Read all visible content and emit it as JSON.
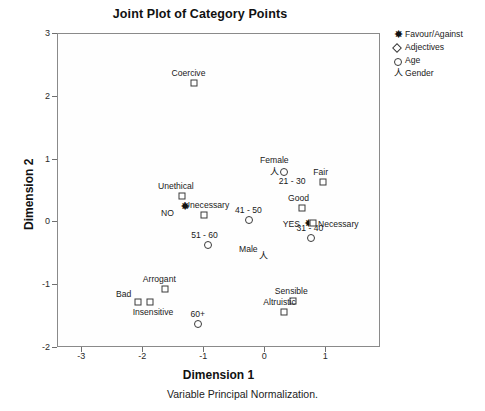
{
  "chart_data": {
    "type": "scatter",
    "title": "Joint Plot of Category Points",
    "xlabel": "Dimension 1",
    "ylabel": "Dimension 2",
    "footnote": "Variable Principal Normalization.",
    "xlim": [
      -3.4,
      1.9
    ],
    "ylim": [
      -2,
      3
    ],
    "xticks": [
      -3,
      -2,
      -1,
      0,
      1
    ],
    "yticks": [
      -2,
      -1,
      0,
      1,
      2,
      3
    ],
    "grid": false,
    "legend_position": "top-right",
    "legend": [
      {
        "label": "Favour/Against",
        "marker": "star-icon"
      },
      {
        "label": "Adjectives",
        "marker": "diamond-icon"
      },
      {
        "label": "Age",
        "marker": "circle-icon"
      },
      {
        "label": "Gender",
        "marker": "person-icon"
      }
    ],
    "series": [
      {
        "name": "Favour/Against",
        "marker": "star-icon",
        "points": [
          {
            "label": "NO",
            "x": -1.3,
            "y": 0.24,
            "label_dx": -24,
            "label_dy": 2
          },
          {
            "label": "YES",
            "x": 0.73,
            "y": -0.02,
            "label_dx": -26,
            "label_dy": -4
          }
        ]
      },
      {
        "name": "Adjectives",
        "marker": "diamond-icon",
        "points": [
          {
            "label": "Coercive",
            "x": -1.16,
            "y": 2.2,
            "label_dx": -22,
            "label_dy": -15
          },
          {
            "label": "Unethical",
            "x": -1.35,
            "y": 0.41,
            "label_dx": -24,
            "label_dy": -15
          },
          {
            "label": "Unecessary",
            "x": -0.99,
            "y": 0.1,
            "label_dx": -20,
            "label_dy": -15
          },
          {
            "label": "Fair",
            "x": 0.97,
            "y": 0.62,
            "label_dx": -10,
            "label_dy": -15
          },
          {
            "label": "Good",
            "x": 0.62,
            "y": 0.22,
            "label_dx": -14,
            "label_dy": -15
          },
          {
            "label": "Necessary",
            "x": 0.8,
            "y": -0.02,
            "label_dx": 5,
            "label_dy": -4
          },
          {
            "label": "Arrogant",
            "x": -1.63,
            "y": -1.07,
            "label_dx": -22,
            "label_dy": -15
          },
          {
            "label": "Bad",
            "x": -2.07,
            "y": -1.28,
            "label_dx": -22,
            "label_dy": -13
          },
          {
            "label": "Insensitive",
            "x": -1.88,
            "y": -1.28,
            "label_dx": -17,
            "label_dy": 5
          },
          {
            "label": "Sensible",
            "x": 0.47,
            "y": -1.26,
            "label_dx": -18,
            "label_dy": -15
          },
          {
            "label": "Altruistic",
            "x": 0.33,
            "y": -1.44,
            "label_dx": -21,
            "label_dy": -15
          }
        ]
      },
      {
        "name": "Age",
        "marker": "circle-icon",
        "points": [
          {
            "label": "21 - 30",
            "x": 0.32,
            "y": 0.79,
            "label_dx": -5,
            "label_dy": 4
          },
          {
            "label": "41 - 50",
            "x": -0.25,
            "y": 0.02,
            "label_dx": -14,
            "label_dy": -15
          },
          {
            "label": "31 - 40",
            "x": 0.76,
            "y": -0.26,
            "label_dx": -14,
            "label_dy": -15
          },
          {
            "label": "51 - 60",
            "x": -0.92,
            "y": -0.38,
            "label_dx": -17,
            "label_dy": -15
          },
          {
            "label": "60+",
            "x": -1.08,
            "y": -1.63,
            "label_dx": -8,
            "label_dy": -15
          }
        ]
      },
      {
        "name": "Gender",
        "marker": "person-icon",
        "points": [
          {
            "label": "Female",
            "x": 0.16,
            "y": 0.79,
            "label_dx": -14,
            "label_dy": -17
          },
          {
            "label": "Male",
            "x": -0.02,
            "y": -0.55,
            "label_dx": -24,
            "label_dy": -12
          }
        ]
      }
    ]
  }
}
